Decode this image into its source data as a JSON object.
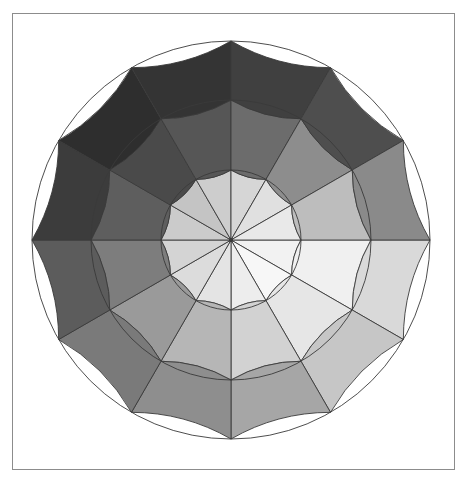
{
  "figure": {
    "kind": "grayscale-color-wheel",
    "background_color": "#ffffff",
    "frame": {
      "border_color": "#8c8c8c",
      "x": 12,
      "y": 13,
      "width": 443,
      "height": 457
    },
    "wheel": {
      "center_x": 231,
      "center_y": 240,
      "inner_radius": 70,
      "middle_radius": 140,
      "outer_radius": 199,
      "sector_count": 12,
      "ring_count": 3,
      "sector_angle_degrees": 30,
      "start_angle_degrees": 0,
      "stroke_color": "#3a3a3a",
      "stroke_width": 0.9
    }
  },
  "chart_data": {
    "type": "pie",
    "title": "",
    "subtitle": "",
    "xlabel": "",
    "ylabel": "",
    "legend_position": "none",
    "grid": false,
    "rings": [
      {
        "name": "inner",
        "inner_radius": 0,
        "outer_radius": 70,
        "values": [
          "#f2f2f2",
          "#f7f7f7",
          "#ededed",
          "#e4e4e4",
          "#dcdcdc",
          "#d4d4d4",
          "#cbcbcb",
          "#c4c4c4",
          "#cdcdcd",
          "#d6d6d6",
          "#e0e0e0",
          "#e9e9e9"
        ]
      },
      {
        "name": "middle",
        "inner_radius": 70,
        "outer_radius": 140,
        "values": [
          "#f0f0f0",
          "#e6e6e6",
          "#d2d2d2",
          "#b6b6b6",
          "#9a9a9a",
          "#7d7d7d",
          "#5e5e5e",
          "#4a4a4a",
          "#565656",
          "#6c6c6c",
          "#8d8d8d",
          "#bdbdbd"
        ]
      },
      {
        "name": "outer",
        "inner_radius": 140,
        "outer_radius": 199,
        "values": [
          "#d9d9d9",
          "#c6c6c6",
          "#a6a6a6",
          "#8e8e8e",
          "#7a7a7a",
          "#5c5c5c",
          "#3c3c3c",
          "#2e2e2e",
          "#343434",
          "#404040",
          "#4e4e4e",
          "#8a8a8a"
        ]
      }
    ],
    "sectors": [
      {
        "index": 0,
        "start_angle": 0,
        "end_angle": 30,
        "label": "0°–30°"
      },
      {
        "index": 1,
        "start_angle": 30,
        "end_angle": 60,
        "label": "30°–60°"
      },
      {
        "index": 2,
        "start_angle": 60,
        "end_angle": 90,
        "label": "60°–90°"
      },
      {
        "index": 3,
        "start_angle": 90,
        "end_angle": 120,
        "label": "90°–120°"
      },
      {
        "index": 4,
        "start_angle": 120,
        "end_angle": 150,
        "label": "120°–150°"
      },
      {
        "index": 5,
        "start_angle": 150,
        "end_angle": 180,
        "label": "150°–180°"
      },
      {
        "index": 6,
        "start_angle": 180,
        "end_angle": 210,
        "label": "180°–210°"
      },
      {
        "index": 7,
        "start_angle": 210,
        "end_angle": 240,
        "label": "210°–240°"
      },
      {
        "index": 8,
        "start_angle": 240,
        "end_angle": 270,
        "label": "240°–270°"
      },
      {
        "index": 9,
        "start_angle": 270,
        "end_angle": 300,
        "label": "270°–300°"
      },
      {
        "index": 10,
        "start_angle": 300,
        "end_angle": 330,
        "label": "300°–330°"
      },
      {
        "index": 11,
        "start_angle": 330,
        "end_angle": 360,
        "label": "330°–360°"
      }
    ]
  }
}
